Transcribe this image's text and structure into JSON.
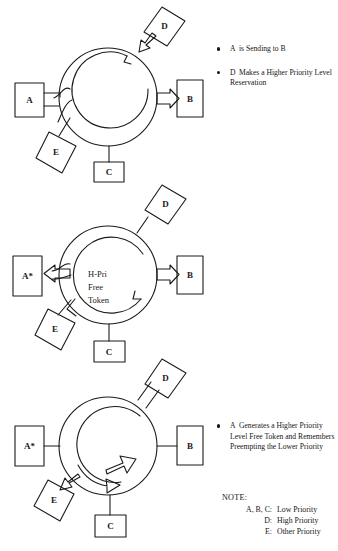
{
  "figure": {
    "background_color": "#ffffff",
    "ink_color": "#151515"
  },
  "panels": [
    {
      "id": "panel-1",
      "ring_label": "",
      "nodes": [
        {
          "id": "A",
          "label": "A",
          "shape": "rect",
          "role": "sender"
        },
        {
          "id": "B",
          "label": "B",
          "shape": "rect",
          "role": "receiver"
        },
        {
          "id": "C",
          "label": "C",
          "shape": "rect",
          "role": "station"
        },
        {
          "id": "D",
          "label": "D",
          "shape": "diamond",
          "role": "reserver"
        },
        {
          "id": "E",
          "label": "E",
          "shape": "diamond",
          "role": "station"
        }
      ],
      "captions": [
        {
          "lead": "A",
          "text": "is Sending to B"
        },
        {
          "lead": "D",
          "text": "Makes a Higher Priority Level Reservation"
        }
      ]
    },
    {
      "id": "panel-2",
      "ring_label": "H-Pri\nFree\nToken",
      "ring_label_lines": [
        "H-Pri",
        "Free",
        "Token"
      ],
      "nodes": [
        {
          "id": "A",
          "label": "A*",
          "shape": "rect",
          "role": "preempted-sender"
        },
        {
          "id": "B",
          "label": "B",
          "shape": "rect",
          "role": "receiver"
        },
        {
          "id": "C",
          "label": "C",
          "shape": "rect",
          "role": "station"
        },
        {
          "id": "D",
          "label": "D",
          "shape": "diamond",
          "role": "reserver"
        },
        {
          "id": "E",
          "label": "E",
          "shape": "diamond",
          "role": "station"
        }
      ],
      "captions": [
        {
          "lead": "A",
          "text": "Generates a Higher Priority Level Free Token and Remembers Preempting the Lower Priority"
        }
      ]
    },
    {
      "id": "panel-3",
      "ring_label": "",
      "nodes": [
        {
          "id": "A",
          "label": "A*",
          "shape": "rect",
          "role": "preempted-sender"
        },
        {
          "id": "B",
          "label": "B",
          "shape": "rect",
          "role": "station"
        },
        {
          "id": "C",
          "label": "C",
          "shape": "rect",
          "role": "station"
        },
        {
          "id": "D",
          "label": "D",
          "shape": "diamond",
          "role": "sender"
        },
        {
          "id": "E",
          "label": "E",
          "shape": "diamond",
          "role": "receiver"
        }
      ],
      "captions": [
        {
          "lead": "D",
          "text": "Uses the Free Token to send Data to E"
        }
      ]
    }
  ],
  "note": {
    "title": "NOTE:",
    "rows": [
      {
        "key": "A, B, C:",
        "value": "Low Priority"
      },
      {
        "key": "D:",
        "value": "High Priority"
      },
      {
        "key": "E:",
        "value": "Other Priority"
      }
    ]
  }
}
